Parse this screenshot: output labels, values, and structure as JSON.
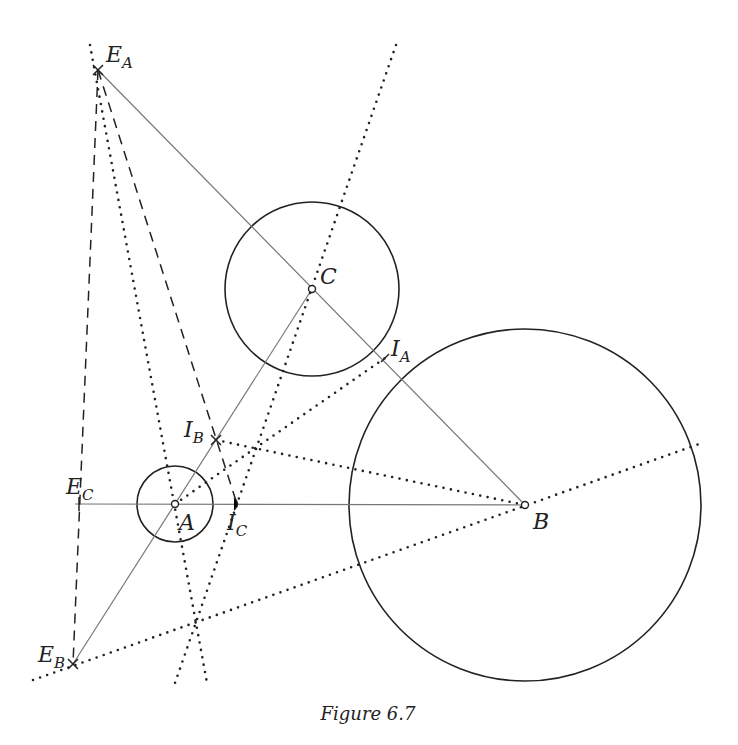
{
  "figure": {
    "caption": "Figure 6.7",
    "points": {
      "A": {
        "label": "A",
        "sub": "",
        "x": 175,
        "y": 504
      },
      "B": {
        "label": "B",
        "sub": "",
        "x": 525,
        "y": 505
      },
      "C": {
        "label": "C",
        "sub": "",
        "x": 312,
        "y": 289
      },
      "EA": {
        "label": "E",
        "sub": "A",
        "x": 98,
        "y": 70
      },
      "EB": {
        "label": "E",
        "sub": "B",
        "x": 73,
        "y": 664
      },
      "EC": {
        "label": "E",
        "sub": "C",
        "x": 79,
        "y": 504
      },
      "IA": {
        "label": "I",
        "sub": "A",
        "x": 385,
        "y": 358
      },
      "IB": {
        "label": "I",
        "sub": "B",
        "x": 216,
        "y": 440
      },
      "IC": {
        "label": "I",
        "sub": "C",
        "x": 237,
        "y": 504
      }
    },
    "circles": [
      {
        "center": "A",
        "r": 38
      },
      {
        "center": "B",
        "r": 176
      },
      {
        "center": "C",
        "r": 87
      }
    ]
  }
}
